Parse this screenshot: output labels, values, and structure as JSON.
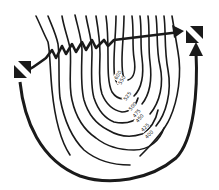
{
  "diagram": {
    "type": "dive-site-contour-map",
    "depth_labels": [
      {
        "text": "600",
        "x": 117,
        "y": 80,
        "rot": -60
      },
      {
        "text": "550",
        "x": 121,
        "y": 85,
        "rot": -60
      },
      {
        "text": "525",
        "x": 126,
        "y": 101,
        "rot": -55
      },
      {
        "text": "500",
        "x": 131,
        "y": 111,
        "rot": -50
      },
      {
        "text": "475",
        "x": 135,
        "y": 118,
        "rot": -50
      },
      {
        "text": "450",
        "x": 138,
        "y": 123,
        "rot": -50
      },
      {
        "text": "425",
        "x": 143,
        "y": 132,
        "rot": -45
      },
      {
        "text": "400",
        "x": 147,
        "y": 139,
        "rot": -45
      }
    ],
    "markers": [
      {
        "name": "entry-flag",
        "x": 14,
        "y": 61
      },
      {
        "name": "exit-flag",
        "x": 183,
        "y": 25
      }
    ],
    "colors": {
      "ink": "#1a1a1a",
      "paper": "#ffffff"
    }
  }
}
